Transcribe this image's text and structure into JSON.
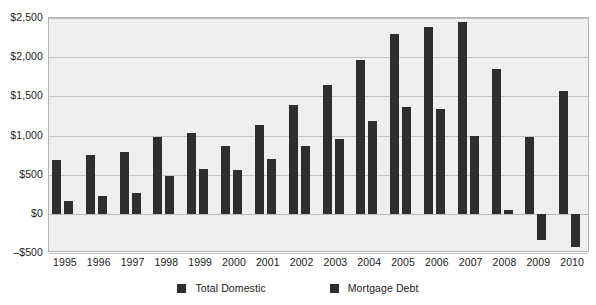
{
  "chart_data": {
    "type": "bar",
    "title": "",
    "subtitle": "",
    "xlabel": "",
    "ylabel": "",
    "categories": [
      "1995",
      "1996",
      "1997",
      "1998",
      "1999",
      "2000",
      "2001",
      "2002",
      "2003",
      "2004",
      "2005",
      "2006",
      "2007",
      "2008",
      "2009",
      "2010"
    ],
    "series": [
      {
        "name": "Total Domestic",
        "color": "#2e2e2e",
        "values": [
          690,
          750,
          790,
          980,
          1030,
          860,
          1130,
          1390,
          1640,
          1960,
          2290,
          2380,
          2450,
          1850,
          980,
          1570
        ]
      },
      {
        "name": "Mortgage Debt",
        "color": "#2e2e2e",
        "values": [
          160,
          230,
          270,
          480,
          570,
          560,
          700,
          870,
          960,
          1190,
          1370,
          1340,
          1000,
          50,
          -330,
          -420
        ]
      }
    ],
    "ylim": [
      -500,
      2500
    ],
    "ytick_values": [
      2500,
      2000,
      1500,
      1000,
      500,
      0,
      -500
    ],
    "ytick_labels": [
      "$2,500",
      "$2,000",
      "$1,500",
      "$1,000",
      "$500",
      "$0",
      "–$500"
    ],
    "grid": true,
    "legend_position": "bottom",
    "plot_background": "#efefef",
    "gridline_color": "#c3c3c3",
    "axis_border_color": "#b4b4b4",
    "page_background": "#ffffff"
  },
  "legend": {
    "items": [
      {
        "label": "Total Domestic",
        "swatch_icon": "square-swatch-icon"
      },
      {
        "label": "Mortgage Debt",
        "swatch_icon": "square-swatch-icon"
      }
    ]
  }
}
